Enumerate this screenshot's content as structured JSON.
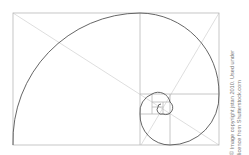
{
  "diagram": {
    "colors": {
      "frame": "#b8b8b8",
      "spiral": "#555555",
      "diagonal": "#d6d6d6",
      "background": "#ffffff"
    },
    "frame": {
      "x": 12,
      "y": 13,
      "width": 207,
      "height": 132
    }
  },
  "credit": {
    "line1": "© Image copyright jstan 2010. Used under",
    "line2": "licence from Shutterstock.com"
  }
}
